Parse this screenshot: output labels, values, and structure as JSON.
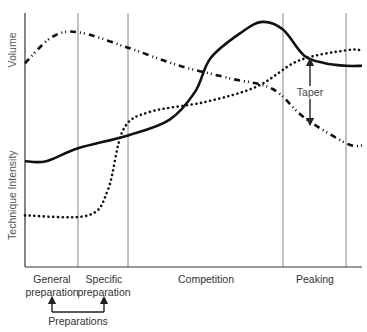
{
  "chart_data": {
    "type": "line",
    "title": "",
    "y_axis_labels": [
      "Volume",
      "Intensity",
      "Technique"
    ],
    "phases": [
      {
        "name": "general-preparation",
        "label_lines": [
          "General",
          "preparation"
        ],
        "x_range": [
          0,
          1
        ]
      },
      {
        "name": "specific-preparation",
        "label_lines": [
          "Specific",
          "preparation"
        ],
        "x_range": [
          1,
          2
        ]
      },
      {
        "name": "competition",
        "label_lines": [
          "Competition"
        ],
        "x_range": [
          2,
          5
        ]
      },
      {
        "name": "peaking",
        "label_lines": [
          "Peaking"
        ],
        "x_range": [
          5,
          6.2
        ]
      }
    ],
    "dividers_x": [
      1,
      2,
      5,
      6.2
    ],
    "xlim": [
      0,
      6.5
    ],
    "ylim": [
      0,
      100
    ],
    "series": [
      {
        "name": "Intensity",
        "style": "solid",
        "points": [
          [
            0,
            41
          ],
          [
            0.4,
            41
          ],
          [
            1,
            46
          ],
          [
            2,
            51
          ],
          [
            2.8,
            57
          ],
          [
            3.3,
            68
          ],
          [
            3.6,
            81
          ],
          [
            4.2,
            91
          ],
          [
            4.6,
            95
          ],
          [
            5,
            92
          ],
          [
            5.4,
            82
          ],
          [
            5.8,
            79
          ],
          [
            6.2,
            78
          ],
          [
            6.5,
            78
          ]
        ]
      },
      {
        "name": "Technique",
        "style": "dotted",
        "points": [
          [
            0,
            20
          ],
          [
            1.2,
            20
          ],
          [
            1.6,
            30
          ],
          [
            1.9,
            53
          ],
          [
            2.4,
            60
          ],
          [
            3.5,
            64
          ],
          [
            4.5,
            70
          ],
          [
            5.3,
            80
          ],
          [
            6.2,
            84
          ],
          [
            6.5,
            84
          ]
        ]
      },
      {
        "name": "Volume",
        "style": "dash-dot",
        "points": [
          [
            0,
            79
          ],
          [
            0.5,
            89
          ],
          [
            1,
            91
          ],
          [
            2,
            85
          ],
          [
            3,
            78
          ],
          [
            4,
            73
          ],
          [
            4.8,
            69
          ],
          [
            5.4,
            58
          ],
          [
            6.2,
            48
          ],
          [
            6.5,
            47
          ]
        ]
      }
    ],
    "annotations": [
      {
        "name": "taper",
        "text": "Taper",
        "type": "double-arrow",
        "x": 5.5,
        "y_range": [
          60,
          85
        ]
      },
      {
        "name": "preparations",
        "text": "Preparations",
        "type": "bracket-arrows",
        "targets": [
          "general-preparation",
          "specific-preparation"
        ]
      }
    ]
  }
}
